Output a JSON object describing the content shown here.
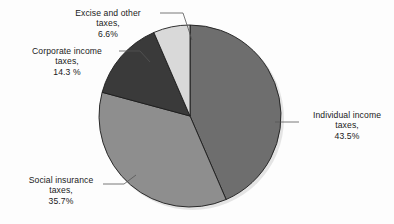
{
  "chart_data": {
    "type": "pie",
    "title": "",
    "subtitle": "",
    "xlabel": "",
    "ylabel": "",
    "legend_position": "none",
    "grid": false,
    "labels_position": "outside-with-leader-lines",
    "start_angle_deg": 0,
    "direction": "clockwise",
    "categories": [
      "Individual income taxes",
      "Social insurance taxes",
      "Corporate income taxes",
      "Excise and other taxes"
    ],
    "values": [
      43.5,
      35.7,
      14.3,
      6.6
    ],
    "value_unit": "percent",
    "slices": [
      {
        "name": "Individual income taxes",
        "value": 43.5,
        "value_text": "43.5%",
        "color": "#6e6e6e",
        "start_deg": 0,
        "end_deg": 156.6
      },
      {
        "name": "Social insurance taxes",
        "value": 35.7,
        "value_text": "35.7%",
        "color": "#8e8e8e",
        "start_deg": 156.6,
        "end_deg": 285.1
      },
      {
        "name": "Corporate income taxes",
        "value": 14.3,
        "value_text": "14.3 %",
        "color": "#3a3a3a",
        "start_deg": 285.1,
        "end_deg": 336.6
      },
      {
        "name": "Excise and other taxes",
        "value": 6.6,
        "value_text": "6.6%",
        "color": "#d9d9d9",
        "start_deg": 336.6,
        "end_deg": 360
      }
    ]
  },
  "callouts": {
    "excise": {
      "line1": "Excise and other",
      "line2": "taxes,",
      "line3": "6.6%"
    },
    "corporate": {
      "line1": "Corporate income",
      "line2": "taxes,",
      "line3": "14.3 %"
    },
    "social": {
      "line1": "Social insurance",
      "line2": "taxes,",
      "line3": "35.7%"
    },
    "individual": {
      "line1": "Individual income",
      "line2": "taxes,",
      "line3": "43.5%"
    }
  },
  "style": {
    "background": "#fdfdfd",
    "text_color": "#1a1a1a",
    "slice_outline": "#1c1c1c",
    "leader_line_color": "#555555"
  }
}
